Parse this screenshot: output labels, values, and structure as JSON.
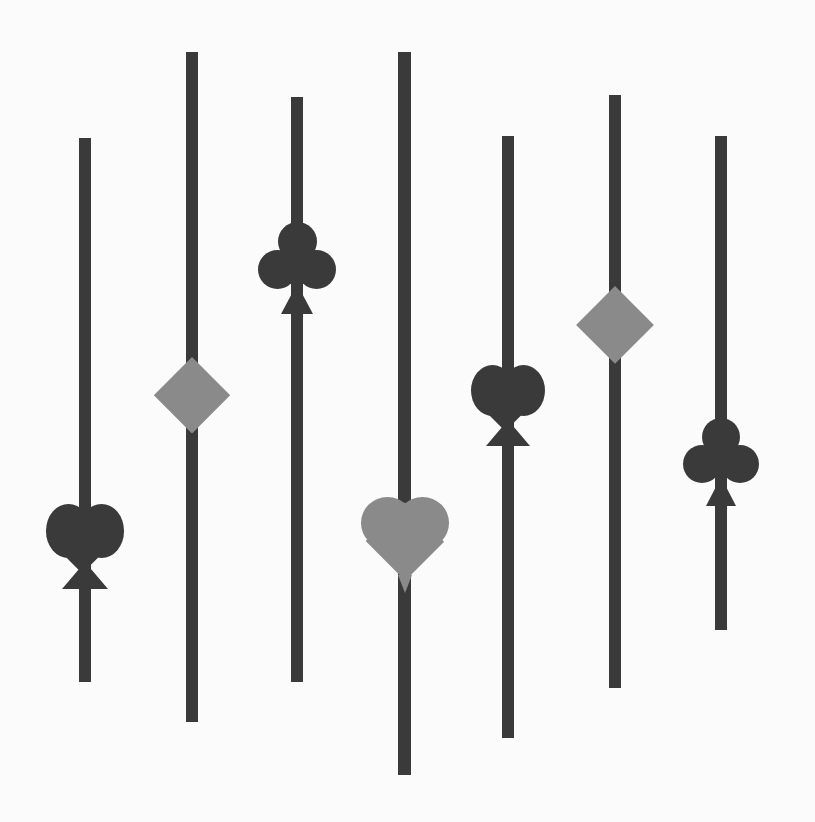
{
  "canvas": {
    "width": 815,
    "height": 822,
    "background": "#fbfbfb",
    "title": "Card suit slider controls"
  },
  "colors": {
    "track": "#3a3a3a",
    "suit_dark": "#3a3a3a",
    "suit_light": "#8a8a8a"
  },
  "sliders": [
    {
      "id": "slider-1",
      "suit": "spade",
      "suit_color": "#3a3a3a",
      "track": {
        "x": 79,
        "y": 138,
        "width": 12,
        "height": 544
      },
      "handle": {
        "center_x": 85,
        "center_y": 543,
        "width": 78,
        "height": 92
      },
      "value_label": "74%"
    },
    {
      "id": "slider-2",
      "suit": "diamond",
      "suit_color": "#8a8a8a",
      "track": {
        "x": 186,
        "y": 52,
        "width": 12,
        "height": 670
      },
      "handle": {
        "center_x": 192,
        "center_y": 395,
        "width": 76,
        "height": 76
      },
      "value_label": "51%"
    },
    {
      "id": "slider-3",
      "suit": "club",
      "suit_color": "#3a3a3a",
      "track": {
        "x": 291,
        "y": 97,
        "width": 12,
        "height": 585
      },
      "handle": {
        "center_x": 297,
        "center_y": 268,
        "width": 78,
        "height": 92
      },
      "value_label": "29%"
    },
    {
      "id": "slider-4",
      "suit": "heart",
      "suit_color": "#8a8a8a",
      "track": {
        "x": 398,
        "y": 52,
        "width": 13,
        "height": 723
      },
      "handle": {
        "center_x": 405,
        "center_y": 540,
        "width": 88,
        "height": 86
      },
      "value_label": "67%"
    },
    {
      "id": "slider-5",
      "suit": "spade",
      "suit_color": "#3a3a3a",
      "track": {
        "x": 502,
        "y": 136,
        "width": 12,
        "height": 602
      },
      "handle": {
        "center_x": 508,
        "center_y": 402,
        "width": 74,
        "height": 88
      },
      "value_label": "44%"
    },
    {
      "id": "slider-6",
      "suit": "diamond",
      "suit_color": "#8a8a8a",
      "track": {
        "x": 609,
        "y": 95,
        "width": 12,
        "height": 593
      },
      "handle": {
        "center_x": 615,
        "center_y": 325,
        "width": 78,
        "height": 78
      },
      "value_label": "39%"
    },
    {
      "id": "slider-7",
      "suit": "club",
      "suit_color": "#3a3a3a",
      "track": {
        "x": 715,
        "y": 136,
        "width": 12,
        "height": 494
      },
      "handle": {
        "center_x": 721,
        "center_y": 462,
        "width": 76,
        "height": 88
      },
      "value_label": "66%"
    }
  ]
}
